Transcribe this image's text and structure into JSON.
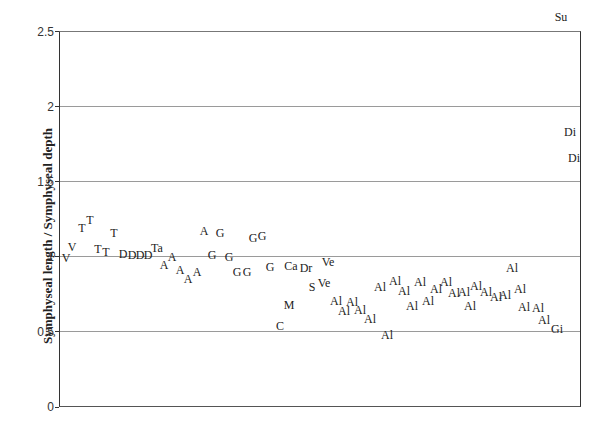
{
  "chart_data": {
    "type": "scatter",
    "title": "",
    "xlabel": "",
    "ylabel": "Symphyseal length / Symphyseal depth",
    "ylim": [
      0,
      2.5
    ],
    "yticks": [
      "0",
      "0.5",
      "1",
      "1.5",
      "2",
      "2.5"
    ],
    "grid": "horizontal",
    "legend": "none",
    "marker": "text labels",
    "points": [
      {
        "label": "V",
        "x": 1,
        "y": 0.99
      },
      {
        "label": "V",
        "x": 2,
        "y": 1.07
      },
      {
        "label": "T",
        "x": 3,
        "y": 1.19
      },
      {
        "label": "T",
        "x": 4,
        "y": 1.25
      },
      {
        "label": "T",
        "x": 5,
        "y": 1.05
      },
      {
        "label": "T",
        "x": 6,
        "y": 1.03
      },
      {
        "label": "T",
        "x": 7,
        "y": 1.16
      },
      {
        "label": "D",
        "x": 8,
        "y": 1.02
      },
      {
        "label": "D",
        "x": 9,
        "y": 1.01
      },
      {
        "label": "D",
        "x": 10,
        "y": 1.01
      },
      {
        "label": "D",
        "x": 11,
        "y": 1.01
      },
      {
        "label": "Ta",
        "x": 12,
        "y": 1.06
      },
      {
        "label": "A",
        "x": 13,
        "y": 0.95
      },
      {
        "label": "A",
        "x": 14,
        "y": 1.0
      },
      {
        "label": "A",
        "x": 15,
        "y": 0.91
      },
      {
        "label": "A",
        "x": 16,
        "y": 0.85
      },
      {
        "label": "A",
        "x": 17,
        "y": 0.9
      },
      {
        "label": "A",
        "x": 18,
        "y": 1.17
      },
      {
        "label": "G",
        "x": 19,
        "y": 1.01
      },
      {
        "label": "G",
        "x": 20,
        "y": 1.16
      },
      {
        "label": "G",
        "x": 21,
        "y": 1.0
      },
      {
        "label": "G",
        "x": 22,
        "y": 0.9
      },
      {
        "label": "G",
        "x": 23,
        "y": 0.9
      },
      {
        "label": "G",
        "x": 24,
        "y": 1.13
      },
      {
        "label": "G",
        "x": 25,
        "y": 1.14
      },
      {
        "label": "G",
        "x": 26,
        "y": 0.93
      },
      {
        "label": "C",
        "x": 27,
        "y": 0.54
      },
      {
        "label": "M",
        "x": 28,
        "y": 0.68
      },
      {
        "label": "Ca",
        "x": 29,
        "y": 0.94
      },
      {
        "label": "Dr",
        "x": 30,
        "y": 0.93
      },
      {
        "label": "S",
        "x": 31,
        "y": 0.8
      },
      {
        "label": "Ve",
        "x": 32,
        "y": 0.83
      },
      {
        "label": "Ve",
        "x": 33,
        "y": 0.97
      },
      {
        "label": "Al",
        "x": 34,
        "y": 0.7
      },
      {
        "label": "Al",
        "x": 35,
        "y": 0.64
      },
      {
        "label": "Al",
        "x": 36,
        "y": 0.69
      },
      {
        "label": "Al",
        "x": 37,
        "y": 0.65
      },
      {
        "label": "Al",
        "x": 38,
        "y": 0.6
      },
      {
        "label": "Al",
        "x": 39,
        "y": 0.48
      },
      {
        "label": "Al",
        "x": 40,
        "y": 0.79
      },
      {
        "label": "Al",
        "x": 41,
        "y": 0.82
      },
      {
        "label": "Al",
        "x": 42,
        "y": 0.77
      },
      {
        "label": "Al",
        "x": 43,
        "y": 0.66
      },
      {
        "label": "Al",
        "x": 44,
        "y": 0.82
      },
      {
        "label": "Al",
        "x": 45,
        "y": 0.68
      },
      {
        "label": "Al",
        "x": 46,
        "y": 0.78
      },
      {
        "label": "Al",
        "x": 47,
        "y": 0.82
      },
      {
        "label": "Al",
        "x": 48,
        "y": 0.76
      },
      {
        "label": "Al",
        "x": 49,
        "y": 0.77
      },
      {
        "label": "Al",
        "x": 50,
        "y": 0.67
      },
      {
        "label": "Al",
        "x": 51,
        "y": 0.81
      },
      {
        "label": "Al",
        "x": 52,
        "y": 0.76
      },
      {
        "label": "Al",
        "x": 53,
        "y": 0.73
      },
      {
        "label": "Al",
        "x": 54,
        "y": 0.74
      },
      {
        "label": "Al",
        "x": 55,
        "y": 0.91
      },
      {
        "label": "Al",
        "x": 56,
        "y": 0.78
      },
      {
        "label": "Al",
        "x": 57,
        "y": 0.66
      },
      {
        "label": "Al",
        "x": 58,
        "y": 0.65
      },
      {
        "label": "Al",
        "x": 59,
        "y": 0.57
      },
      {
        "label": "Gi",
        "x": 60,
        "y": 0.52
      },
      {
        "label": "Su",
        "x": 61,
        "y": 2.43
      },
      {
        "label": "Di",
        "x": 62,
        "y": 1.83
      },
      {
        "label": "Di",
        "x": 63,
        "y": 1.66
      }
    ]
  },
  "positions": [
    [
      66,
      258
    ],
    [
      72,
      247
    ],
    [
      82,
      228
    ],
    [
      90,
      220
    ],
    [
      98,
      249
    ],
    [
      106,
      252
    ],
    [
      114,
      233
    ],
    [
      123,
      254
    ],
    [
      132,
      255
    ],
    [
      140,
      255
    ],
    [
      148,
      255
    ],
    [
      157,
      248
    ],
    [
      164,
      265
    ],
    [
      172,
      257
    ],
    [
      180,
      270
    ],
    [
      188,
      279
    ],
    [
      197,
      272
    ],
    [
      204,
      231
    ],
    [
      212,
      255
    ],
    [
      220,
      233
    ],
    [
      229,
      257
    ],
    [
      237,
      272
    ],
    [
      247,
      272
    ],
    [
      253,
      238
    ],
    [
      262,
      236
    ],
    [
      270,
      267
    ],
    [
      280,
      326
    ],
    [
      289,
      305
    ],
    [
      291,
      266
    ],
    [
      306,
      268
    ],
    [
      312,
      287
    ],
    [
      324,
      283
    ],
    [
      328,
      262
    ],
    [
      336,
      301
    ],
    [
      344,
      311
    ],
    [
      352,
      302
    ],
    [
      360,
      310
    ],
    [
      370,
      319
    ],
    [
      387,
      335
    ],
    [
      380,
      287
    ],
    [
      395,
      281
    ],
    [
      404,
      291
    ],
    [
      412,
      306
    ],
    [
      420,
      282
    ],
    [
      428,
      301
    ],
    [
      436,
      289
    ],
    [
      446,
      282
    ],
    [
      454,
      293
    ],
    [
      464,
      292
    ],
    [
      470,
      306
    ],
    [
      476,
      286
    ],
    [
      486,
      292
    ],
    [
      496,
      297
    ],
    [
      505,
      295
    ],
    [
      512,
      268
    ],
    [
      520,
      289
    ],
    [
      524,
      307
    ],
    [
      538,
      308
    ],
    [
      544,
      320
    ],
    [
      557,
      329
    ],
    [
      561,
      17
    ],
    [
      570,
      132
    ],
    [
      574,
      158
    ]
  ]
}
